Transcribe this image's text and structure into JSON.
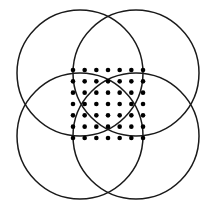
{
  "figure": {
    "canvas": {
      "width": 216,
      "height": 213,
      "background_color": "#ffffff"
    },
    "stroke_color": "#1a1a1a",
    "stroke_width": 1.5,
    "dot_color": "#000000",
    "dot_radius": 2.3
  },
  "chart_data": {
    "type": "scatter",
    "subtitle": "",
    "xlabel": "",
    "ylabel": "",
    "grid": false,
    "legend_position": "none",
    "xlim": [
      0,
      216
    ],
    "ylim": [
      0,
      213
    ],
    "circles": [
      {
        "name": "top-left-circle",
        "cx": 80,
        "cy": 73,
        "r": 63
      },
      {
        "name": "top-right-circle",
        "cx": 136,
        "cy": 73,
        "r": 63
      },
      {
        "name": "bottom-left-circle",
        "cx": 80,
        "cy": 136,
        "r": 63
      },
      {
        "name": "bottom-right-circle",
        "cx": 136,
        "cy": 136,
        "r": 63
      }
    ],
    "lattice": {
      "name": "central-dot-lattice",
      "rows": 7,
      "cols": 7,
      "count": 49,
      "x_start": 73,
      "y_start": 70,
      "x_step": 11.67,
      "y_step": 11.33
    },
    "x": [
      73,
      84.67,
      96.34,
      108.01,
      119.68,
      131.35,
      143.02,
      73,
      84.67,
      96.34,
      108.01,
      119.68,
      131.35,
      143.02,
      73,
      84.67,
      96.34,
      108.01,
      119.68,
      131.35,
      143.02,
      73,
      84.67,
      96.34,
      108.01,
      119.68,
      131.35,
      143.02,
      73,
      84.67,
      96.34,
      108.01,
      119.68,
      131.35,
      143.02,
      73,
      84.67,
      96.34,
      108.01,
      119.68,
      131.35,
      143.02,
      73,
      84.67,
      96.34,
      108.01,
      119.68,
      131.35,
      143.02
    ],
    "y": [
      70,
      70,
      70,
      70,
      70,
      70,
      70,
      81.33,
      81.33,
      81.33,
      81.33,
      81.33,
      81.33,
      81.33,
      92.66,
      92.66,
      92.66,
      92.66,
      92.66,
      92.66,
      92.66,
      104,
      104,
      104,
      104,
      104,
      104,
      104,
      115.33,
      115.33,
      115.33,
      115.33,
      115.33,
      115.33,
      115.33,
      126.66,
      126.66,
      126.66,
      126.66,
      126.66,
      126.66,
      126.66,
      138,
      138,
      138,
      138,
      138,
      138,
      138
    ]
  }
}
